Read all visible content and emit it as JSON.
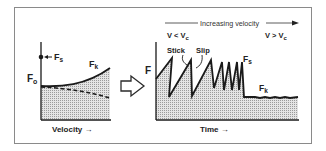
{
  "left_panel": {
    "y_label_main": "F",
    "y_label_sub": "o",
    "static_label_main": "F",
    "static_label_sub": "s",
    "kinetic_label_main": "F",
    "kinetic_label_sub": "k",
    "x_label": "Velocity →"
  },
  "transition_arrow": {
    "icon": "hollow-right-arrow"
  },
  "right_panel": {
    "header": "Increasing velocity",
    "low_regime_main": "V < V",
    "low_regime_sub": "c",
    "high_regime_main": "V > V",
    "high_regime_sub": "c",
    "stick_label": "Stick",
    "slip_label": "Slip",
    "y_label": "F",
    "static_label_main": "F",
    "static_label_sub": "s",
    "kinetic_label_main": "F",
    "kinetic_label_sub": "k",
    "x_label": "Time →"
  },
  "colors": {
    "line": "#1a1a1a",
    "fill": "#cfcfcf",
    "frame": "#8a8a8a"
  }
}
